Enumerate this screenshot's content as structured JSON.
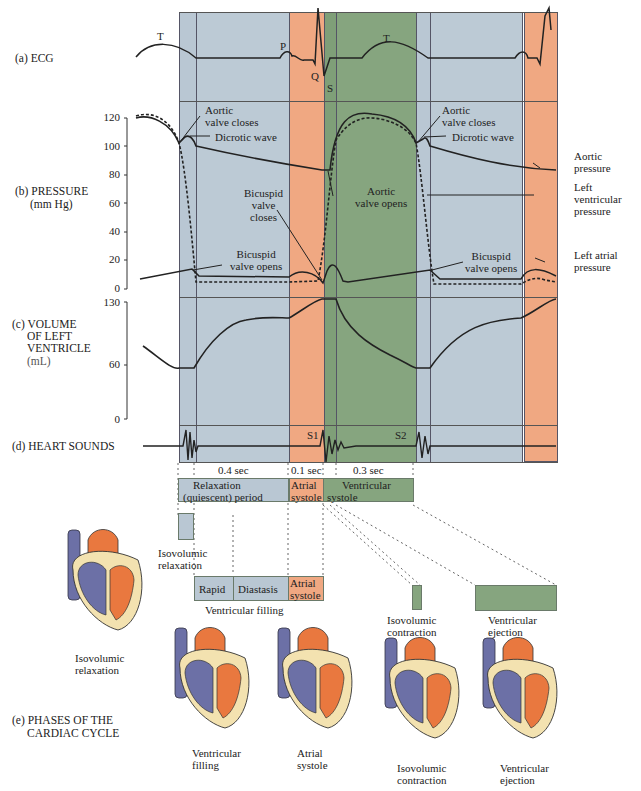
{
  "colors": {
    "relaxation": "#b9c7d3",
    "atrial_systole": "#f0a882",
    "ventricular_systole": "#86a57f",
    "vein_blue": "#6c70a6",
    "artery_orange": "#e9783f",
    "myocardium": "#f3e2b0",
    "line": "#222222"
  },
  "rows": {
    "ecg": "(a) ECG",
    "pressure": "(b) PRESSURE",
    "pressure_unit": "(mm Hg)",
    "volume_1": "(c) VOLUME",
    "volume_2": "OF LEFT",
    "volume_3": "VENTRICLE",
    "volume_unit": "(mL)",
    "sounds": "(d) HEART SOUNDS",
    "phases_1": "(e) PHASES OF THE",
    "phases_2": "CARDIAC CYCLE"
  },
  "ecg_waves": {
    "t1": "T",
    "p": "P",
    "q": "Q",
    "s": "S",
    "t2": "T"
  },
  "pressure_ticks": [
    "120",
    "100",
    "80",
    "60",
    "40",
    "20",
    "0"
  ],
  "volume_ticks": [
    "130",
    "60",
    "0"
  ],
  "annotations": {
    "aortic_closes_1a": "Aortic",
    "aortic_closes_1b": "valve closes",
    "dicrotic_1": "Dicrotic wave",
    "bicuspid_closes_a": "Bicuspid",
    "bicuspid_closes_b": "valve",
    "bicuspid_closes_c": "closes",
    "bicuspid_opens_1a": "Bicuspid",
    "bicuspid_opens_1b": "valve opens",
    "aortic_opens_a": "Aortic",
    "aortic_opens_b": "valve opens",
    "aortic_closes_2a": "Aortic",
    "aortic_closes_2b": "valve closes",
    "dicrotic_2": "Dicrotic wave",
    "bicuspid_opens_2a": "Bicuspid",
    "bicuspid_opens_2b": "valve opens",
    "aortic_pressure_a": "Aortic",
    "aortic_pressure_b": "pressure",
    "lv_pressure_a": "Left",
    "lv_pressure_b": "ventricular",
    "lv_pressure_c": "pressure",
    "la_pressure_a": "Left atrial",
    "la_pressure_b": "pressure"
  },
  "sounds": {
    "s1": "S1",
    "s2": "S2"
  },
  "durations": {
    "relax": "0.4 sec",
    "atrial": "0.1 sec",
    "vent": "0.3 sec"
  },
  "phase_bar": {
    "relax_a": "Relaxation",
    "relax_b": "(quiescent) period",
    "atrial_a": "Atrial",
    "atrial_b": "systole",
    "vent_a": "Ventricular",
    "vent_b": "systole"
  },
  "sub_phases": {
    "iso_relax_a": "Isovolumic",
    "iso_relax_b": "relaxation",
    "rapid": "Rapid",
    "diastasis": "Diastasis",
    "atrial_a": "Atrial",
    "atrial_b": "systole",
    "vent_filling": "Ventricular filling",
    "iso_contr_a": "Isovolumic",
    "iso_contr_b": "contraction",
    "vent_eject_a": "Ventricular",
    "vent_eject_b": "ejection"
  },
  "hearts": [
    {
      "a": "Isovolumic",
      "b": "relaxation"
    },
    {
      "a": "Ventricular",
      "b": "filling"
    },
    {
      "a": "Atrial",
      "b": "systole"
    },
    {
      "a": "Isovolumic",
      "b": "contraction"
    },
    {
      "a": "Ventricular",
      "b": "ejection"
    }
  ]
}
